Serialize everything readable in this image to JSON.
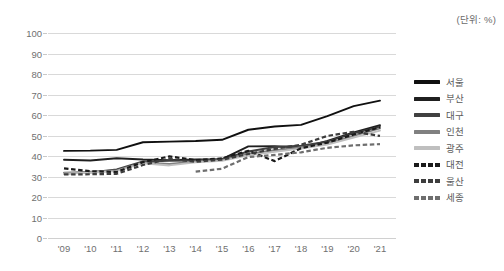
{
  "unit_note": "(단위: %)",
  "axis": {
    "y_ticks": [
      "100",
      "90",
      "80",
      "70",
      "60",
      "50",
      "40",
      "30",
      "20",
      "10",
      "0"
    ],
    "x_ticks": [
      "'09",
      "'10",
      "'11",
      "'12",
      "'13",
      "'14",
      "'15",
      "'16",
      "'17",
      "'18",
      "'19",
      "'20",
      "'21"
    ]
  },
  "legend": {
    "items": [
      {
        "label": "서울",
        "color": "#101010",
        "style": "solid"
      },
      {
        "label": "부산",
        "color": "#1f1f1f",
        "style": "solid"
      },
      {
        "label": "대구",
        "color": "#404040",
        "style": "solid"
      },
      {
        "label": "인천",
        "color": "#808080",
        "style": "solid"
      },
      {
        "label": "광주",
        "color": "#bfbfbf",
        "style": "solid"
      },
      {
        "label": "대전",
        "color": "#1a1a1a",
        "style": "dashed"
      },
      {
        "label": "울산",
        "color": "#3d3d3d",
        "style": "dashed"
      },
      {
        "label": "세종",
        "color": "#6e6e6e",
        "style": "dashed"
      }
    ]
  },
  "chart_data": {
    "type": "line",
    "title": "",
    "subtitle": "",
    "xlabel": "",
    "ylabel": "",
    "unit": "%",
    "annotation": "(단위: %)",
    "grid": true,
    "legend_position": "right",
    "ylim": [
      0,
      100
    ],
    "ytick_step": 10,
    "categories": [
      "'09",
      "'10",
      "'11",
      "'12",
      "'13",
      "'14",
      "'15",
      "'16",
      "'17",
      "'18",
      "'19",
      "'20",
      "'21"
    ],
    "series": [
      {
        "name": "서울",
        "color": "#101010",
        "style": "solid",
        "values": [
          42.5,
          42.6,
          43.0,
          46.7,
          47.0,
          47.3,
          47.9,
          52.8,
          54.4,
          55.2,
          59.5,
          64.3,
          67.0
        ]
      },
      {
        "name": "부산",
        "color": "#1f1f1f",
        "style": "solid",
        "values": [
          38.2,
          37.8,
          38.9,
          38.3,
          38.0,
          38.3,
          38.5,
          44.7,
          44.8,
          44.0,
          47.4,
          51.5,
          55.0
        ]
      },
      {
        "name": "대구",
        "color": "#404040",
        "style": "solid",
        "values": [
          31.5,
          32.0,
          33.4,
          37.3,
          37.6,
          37.8,
          38.5,
          42.2,
          44.4,
          45.0,
          47.0,
          51.0,
          54.2
        ]
      },
      {
        "name": "인천",
        "color": "#808080",
        "style": "solid",
        "values": [
          31.8,
          32.3,
          33.0,
          36.9,
          36.1,
          37.4,
          38.0,
          41.1,
          42.8,
          44.2,
          46.0,
          49.8,
          53.5
        ]
      },
      {
        "name": "광주",
        "color": "#bfbfbf",
        "style": "solid",
        "values": [
          31.4,
          31.8,
          32.6,
          36.5,
          35.4,
          36.9,
          37.6,
          40.3,
          42.0,
          43.6,
          45.6,
          49.0,
          52.4
        ]
      },
      {
        "name": "대전",
        "color": "#1a1a1a",
        "style": "dashed",
        "values": [
          34.0,
          32.6,
          32.2,
          37.0,
          39.8,
          38.0,
          38.8,
          42.5,
          37.5,
          43.8,
          46.5,
          50.5,
          54.0
        ]
      },
      {
        "name": "울산",
        "color": "#3d3d3d",
        "style": "dashed",
        "values": [
          31.0,
          31.1,
          31.3,
          35.6,
          38.6,
          37.2,
          38.2,
          41.0,
          43.5,
          45.5,
          49.8,
          51.8,
          49.8
        ]
      },
      {
        "name": "세종",
        "color": "#6e6e6e",
        "style": "dashed",
        "values": [
          null,
          null,
          null,
          null,
          null,
          32.4,
          33.8,
          39.5,
          40.5,
          41.8,
          44.0,
          45.2,
          45.8
        ]
      }
    ]
  }
}
